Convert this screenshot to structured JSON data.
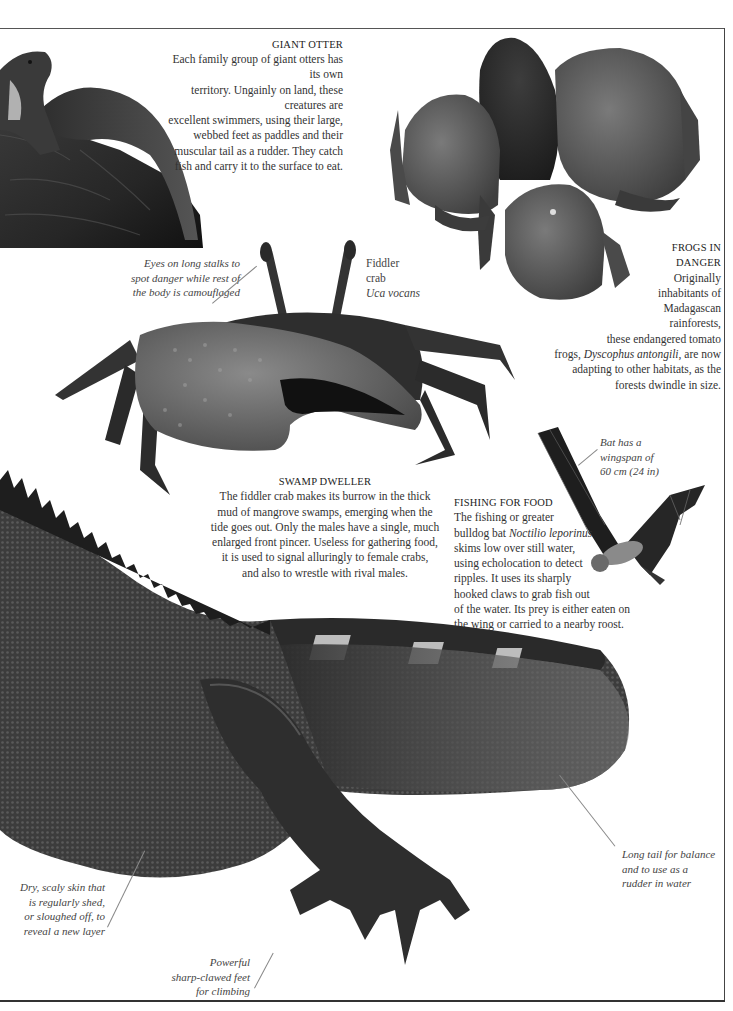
{
  "sections": {
    "giant_otter": {
      "heading": "GIANT OTTER",
      "lines": [
        "Each family group of giant otters has its own",
        "territory. Ungainly on land, these creatures are",
        "excellent swimmers, using their large,",
        "webbed feet as paddles and their",
        "muscular tail as a rudder. They catch",
        "fish and carry it to the surface to eat."
      ]
    },
    "frogs": {
      "heading_lines": [
        "FROGS IN",
        "DANGER"
      ],
      "lines": [
        "Originally",
        "inhabitants of",
        "Madagascan",
        "rainforests,",
        "these endangered tomato"
      ],
      "species_line_prefix": "frogs, ",
      "species": "Dyscophus antongili",
      "species_line_suffix": ", are now",
      "lines_after": [
        "adapting to other habitats, as the",
        "forests dwindle in size."
      ]
    },
    "swamp_dweller": {
      "heading": "SWAMP DWELLER",
      "lines": [
        "The fiddler crab makes its burrow in the thick",
        "mud of mangrove swamps, emerging when the",
        "tide goes out. Only the males have a single, much",
        "enlarged front pincer. Useless for gathering food,",
        "it is used to signal alluringly to female crabs,",
        "and also to wrestle with rival males."
      ]
    },
    "fishing_for_food": {
      "heading": "FISHING FOR FOOD",
      "line1": "The fishing or greater",
      "line2_prefix": "bulldog bat ",
      "line2_species": "Noctilio leporinus",
      "lines_after": [
        "skims low over still water,",
        "using echolocation to detect",
        "ripples. It uses its sharply",
        "hooked claws to grab fish out",
        "of the water. Its prey is either eaten on",
        "the wing or carried to a nearby roost."
      ]
    }
  },
  "labels": {
    "crab_eyes": [
      "Eyes on long stalks to",
      "spot danger while rest of",
      "the body is camouflaged"
    ],
    "fiddler_crab": {
      "common": [
        "Fiddler",
        "crab"
      ],
      "species": "Uca vocans"
    },
    "bat_wingspan": [
      "Bat has a",
      "wingspan of",
      "60 cm (24 in)"
    ],
    "iguana_tail": [
      "Long tail for balance",
      "and to use as a",
      "rudder in water"
    ],
    "iguana_skin": [
      "Dry, scaly skin that",
      "is regularly shed,",
      "or sloughed off, to",
      "reveal a new layer"
    ],
    "iguana_feet": [
      "Powerful",
      "sharp-clawed feet",
      "for climbing"
    ]
  },
  "images": {
    "otter": "giant-otter-photo",
    "frogs": "tomato-frogs-photo",
    "crab": "fiddler-crab-photo",
    "bat": "bulldog-bat-photo",
    "iguana": "iguana-photo"
  }
}
